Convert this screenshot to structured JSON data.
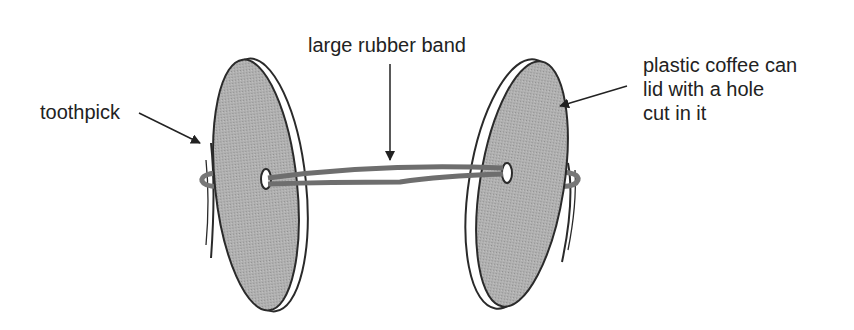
{
  "diagram": {
    "title": "",
    "labels": {
      "toothpick": "toothpick",
      "rubber_band": "large rubber band",
      "lid_line1": "plastic coffee can",
      "lid_line2": "lid with a hole",
      "lid_line3": "cut in it"
    },
    "colors": {
      "lid_fill": "#a8a8a8",
      "lid_outline": "#2a2a2a",
      "rubber_band": "#6e6e6e",
      "text": "#222222",
      "arrow": "#222222",
      "background": "#ffffff"
    },
    "components": [
      {
        "id": "left-lid",
        "type": "disc"
      },
      {
        "id": "right-lid",
        "type": "disc"
      },
      {
        "id": "rubber-band",
        "type": "band"
      },
      {
        "id": "left-toothpick",
        "type": "stick"
      },
      {
        "id": "right-toothpick",
        "type": "stick"
      }
    ]
  }
}
